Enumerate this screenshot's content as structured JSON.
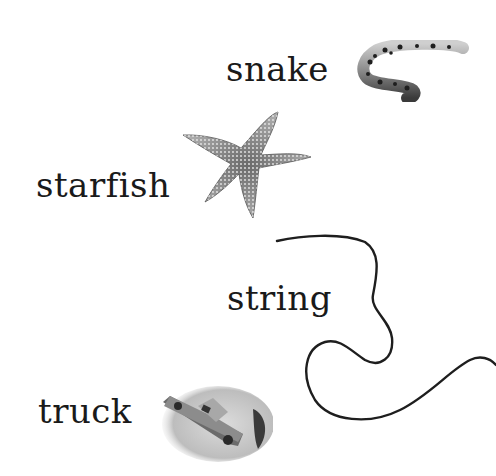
{
  "items": [
    {
      "word": "snake",
      "object": "snake-photo"
    },
    {
      "word": "starfish",
      "object": "starfish-photo"
    },
    {
      "word": "string",
      "object": "string-photo"
    },
    {
      "word": "truck",
      "object": "toy-truck-photo"
    }
  ],
  "colors": {
    "background": "#ffffff",
    "text": "#1a1a1a",
    "object_dark": "#222222"
  }
}
